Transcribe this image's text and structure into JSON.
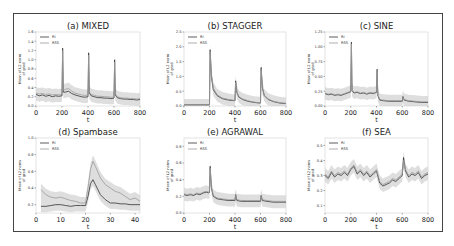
{
  "figure": {
    "frame_color": "#444444",
    "series_colors": {
      "RI": "#333333",
      "RSS": "#9a9a9a",
      "band": "#d0d0d0"
    }
  },
  "chart_data": [
    {
      "id": "a",
      "type": "line",
      "title": "(a) MIXED",
      "xlabel": "t",
      "ylabel": "Mean of L2 norm of grad",
      "xlim": [
        0,
        800
      ],
      "ylim": [
        0.0,
        1.6
      ],
      "xticks": [
        "0",
        "200",
        "400",
        "600",
        "800"
      ],
      "yticks": [
        "0.0",
        "0.2",
        "0.4",
        "0.6",
        "0.8",
        "1.0",
        "1.2",
        "1.4",
        "1.6"
      ],
      "legend": [
        "RI",
        "RSS"
      ],
      "legend_position": "upper left",
      "series": [
        {
          "name": "RI",
          "x": [
            0,
            25,
            50,
            75,
            100,
            125,
            150,
            175,
            200,
            205,
            210,
            225,
            250,
            275,
            300,
            325,
            350,
            375,
            400,
            405,
            410,
            425,
            450,
            475,
            500,
            525,
            550,
            575,
            600,
            605,
            610,
            625,
            650,
            675,
            700,
            725,
            750,
            775,
            800
          ],
          "values": [
            0.25,
            0.22,
            0.24,
            0.21,
            0.23,
            0.2,
            0.22,
            0.21,
            0.22,
            1.25,
            0.3,
            0.3,
            0.32,
            0.27,
            0.24,
            0.22,
            0.2,
            0.19,
            0.2,
            1.15,
            0.28,
            0.22,
            0.2,
            0.18,
            0.18,
            0.17,
            0.17,
            0.16,
            0.17,
            1.0,
            0.24,
            0.18,
            0.16,
            0.15,
            0.15,
            0.14,
            0.14,
            0.13,
            0.14
          ]
        },
        {
          "name": "RSS",
          "x": [
            0,
            25,
            50,
            75,
            100,
            125,
            150,
            175,
            200,
            205,
            210,
            225,
            250,
            275,
            300,
            325,
            350,
            375,
            400,
            405,
            410,
            425,
            450,
            475,
            500,
            525,
            550,
            575,
            600,
            605,
            610,
            625,
            650,
            675,
            700,
            725,
            750,
            775,
            800
          ],
          "values": [
            0.28,
            0.26,
            0.27,
            0.25,
            0.26,
            0.24,
            0.25,
            0.24,
            0.25,
            1.2,
            0.34,
            0.36,
            0.38,
            0.32,
            0.28,
            0.26,
            0.24,
            0.23,
            0.23,
            1.1,
            0.3,
            0.25,
            0.23,
            0.21,
            0.21,
            0.2,
            0.2,
            0.19,
            0.19,
            0.95,
            0.26,
            0.2,
            0.18,
            0.17,
            0.17,
            0.16,
            0.16,
            0.15,
            0.16
          ]
        }
      ]
    },
    {
      "id": "b",
      "type": "line",
      "title": "(b) STAGGER",
      "xlabel": "t",
      "ylabel": "Mean of L2 norm of grad",
      "xlim": [
        0,
        800
      ],
      "ylim": [
        0.0,
        2.5
      ],
      "xticks": [
        "0",
        "200",
        "400",
        "600",
        "800"
      ],
      "yticks": [
        "0.0",
        "0.5",
        "1.0",
        "1.5",
        "2.0",
        "2.5"
      ],
      "legend": [
        "RI",
        "RSS"
      ],
      "legend_position": "upper left",
      "series": [
        {
          "name": "RI",
          "x": [
            0,
            50,
            100,
            150,
            195,
            200,
            205,
            215,
            230,
            260,
            300,
            350,
            395,
            400,
            405,
            415,
            430,
            460,
            500,
            550,
            595,
            600,
            605,
            615,
            630,
            660,
            700,
            750,
            800
          ],
          "values": [
            0.04,
            0.04,
            0.04,
            0.04,
            0.04,
            0.04,
            1.9,
            1.0,
            0.55,
            0.35,
            0.25,
            0.2,
            0.18,
            0.18,
            0.85,
            0.45,
            0.3,
            0.22,
            0.16,
            0.12,
            0.1,
            0.1,
            1.3,
            0.6,
            0.35,
            0.22,
            0.15,
            0.1,
            0.08
          ]
        },
        {
          "name": "RSS",
          "x": [
            0,
            50,
            100,
            150,
            195,
            200,
            205,
            215,
            230,
            260,
            300,
            350,
            395,
            400,
            405,
            415,
            430,
            460,
            500,
            550,
            595,
            600,
            605,
            615,
            630,
            660,
            700,
            750,
            800
          ],
          "values": [
            0.04,
            0.04,
            0.04,
            0.04,
            0.04,
            0.04,
            1.85,
            1.05,
            0.6,
            0.38,
            0.27,
            0.22,
            0.19,
            0.19,
            0.8,
            0.48,
            0.32,
            0.24,
            0.18,
            0.13,
            0.11,
            0.11,
            1.25,
            0.62,
            0.37,
            0.24,
            0.16,
            0.11,
            0.09
          ]
        }
      ]
    },
    {
      "id": "c",
      "type": "line",
      "title": "(c) SINE",
      "xlabel": "t",
      "ylabel": "Mean of L2 norm of grad",
      "xlim": [
        0,
        800
      ],
      "ylim": [
        0.0,
        1.25
      ],
      "xticks": [
        "0",
        "200",
        "400",
        "600",
        "800"
      ],
      "yticks": [
        "0.00",
        "0.25",
        "0.50",
        "0.75",
        "1.00",
        "1.25"
      ],
      "legend": [
        "RI",
        "RSS"
      ],
      "legend_position": "upper left",
      "series": [
        {
          "name": "RI",
          "x": [
            0,
            25,
            50,
            75,
            100,
            125,
            150,
            175,
            200,
            205,
            210,
            225,
            250,
            275,
            300,
            325,
            350,
            375,
            400,
            405,
            410,
            425,
            450,
            500,
            550,
            595,
            600,
            605,
            615,
            650,
            700,
            750,
            800
          ],
          "values": [
            0.21,
            0.19,
            0.2,
            0.18,
            0.19,
            0.18,
            0.2,
            0.22,
            0.24,
            1.08,
            0.26,
            0.22,
            0.23,
            0.21,
            0.22,
            0.2,
            0.22,
            0.21,
            0.23,
            0.62,
            0.18,
            0.1,
            0.09,
            0.08,
            0.08,
            0.08,
            0.08,
            0.16,
            0.1,
            0.08,
            0.07,
            0.06,
            0.06
          ]
        },
        {
          "name": "RSS",
          "x": [
            0,
            25,
            50,
            75,
            100,
            125,
            150,
            175,
            200,
            205,
            210,
            225,
            250,
            275,
            300,
            325,
            350,
            375,
            400,
            405,
            410,
            425,
            450,
            500,
            550,
            595,
            600,
            605,
            615,
            650,
            700,
            750,
            800
          ],
          "values": [
            0.22,
            0.2,
            0.21,
            0.19,
            0.2,
            0.19,
            0.21,
            0.23,
            0.25,
            1.05,
            0.27,
            0.23,
            0.24,
            0.22,
            0.23,
            0.21,
            0.23,
            0.22,
            0.24,
            0.6,
            0.19,
            0.11,
            0.1,
            0.09,
            0.09,
            0.09,
            0.09,
            0.15,
            0.11,
            0.09,
            0.08,
            0.07,
            0.07
          ]
        }
      ]
    },
    {
      "id": "d",
      "type": "line",
      "title": "(d) Spambase",
      "xlabel": "t",
      "ylabel": "Mean of L2 norm of grad",
      "xlim": [
        0,
        42
      ],
      "ylim": [
        0.1,
        1.0
      ],
      "xticks": [
        "0",
        "10",
        "20",
        "30",
        "40"
      ],
      "yticks": [
        "0.2",
        "0.4",
        "0.6",
        "0.8",
        "1.0"
      ],
      "legend": [
        "RI",
        "RSS"
      ],
      "legend_position": "upper left",
      "series": [
        {
          "name": "RI",
          "x": [
            2,
            4,
            6,
            8,
            10,
            12,
            14,
            16,
            18,
            20,
            21,
            22,
            23,
            24,
            26,
            28,
            30,
            32,
            34,
            36,
            38,
            40,
            42
          ],
          "values": [
            0.18,
            0.18,
            0.19,
            0.2,
            0.2,
            0.19,
            0.18,
            0.19,
            0.19,
            0.19,
            0.3,
            0.45,
            0.5,
            0.44,
            0.32,
            0.26,
            0.22,
            0.22,
            0.21,
            0.21,
            0.2,
            0.2,
            0.2
          ]
        },
        {
          "name": "RSS",
          "x": [
            2,
            4,
            6,
            8,
            10,
            12,
            14,
            16,
            18,
            20,
            21,
            22,
            23,
            24,
            26,
            28,
            30,
            32,
            34,
            36,
            38,
            40,
            42
          ],
          "values": [
            0.38,
            0.32,
            0.29,
            0.28,
            0.29,
            0.27,
            0.25,
            0.24,
            0.22,
            0.22,
            0.4,
            0.62,
            0.72,
            0.66,
            0.52,
            0.44,
            0.4,
            0.36,
            0.34,
            0.3,
            0.26,
            0.28,
            0.24
          ]
        }
      ]
    },
    {
      "id": "e",
      "type": "line",
      "title": "(e) AGRAWAL",
      "xlabel": "t",
      "ylabel": "Mean of L2 norm of grad",
      "xlim": [
        0,
        800
      ],
      "ylim": [
        0.0,
        0.9
      ],
      "xticks": [
        "0",
        "200",
        "400",
        "600",
        "800"
      ],
      "yticks": [
        "0.0",
        "0.2",
        "0.4",
        "0.6",
        "0.8"
      ],
      "legend": [
        "RI",
        "RSS"
      ],
      "legend_position": "upper left",
      "series": [
        {
          "name": "RI",
          "x": [
            0,
            25,
            50,
            75,
            100,
            125,
            150,
            175,
            195,
            200,
            205,
            215,
            230,
            260,
            300,
            350,
            395,
            400,
            405,
            415,
            450,
            500,
            550,
            595,
            600,
            605,
            615,
            650,
            700,
            750,
            800
          ],
          "values": [
            0.22,
            0.21,
            0.22,
            0.21,
            0.23,
            0.22,
            0.24,
            0.25,
            0.24,
            0.25,
            0.56,
            0.3,
            0.2,
            0.17,
            0.16,
            0.15,
            0.15,
            0.15,
            0.22,
            0.15,
            0.14,
            0.14,
            0.14,
            0.14,
            0.14,
            0.21,
            0.15,
            0.14,
            0.13,
            0.13,
            0.13
          ]
        },
        {
          "name": "RSS",
          "x": [
            0,
            25,
            50,
            75,
            100,
            125,
            150,
            175,
            195,
            200,
            205,
            215,
            230,
            260,
            300,
            350,
            395,
            400,
            405,
            415,
            450,
            500,
            550,
            595,
            600,
            605,
            615,
            650,
            700,
            750,
            800
          ],
          "values": [
            0.23,
            0.22,
            0.23,
            0.22,
            0.24,
            0.23,
            0.25,
            0.26,
            0.25,
            0.26,
            0.54,
            0.31,
            0.21,
            0.18,
            0.17,
            0.16,
            0.16,
            0.16,
            0.21,
            0.16,
            0.15,
            0.15,
            0.15,
            0.15,
            0.15,
            0.2,
            0.16,
            0.15,
            0.14,
            0.14,
            0.14
          ]
        }
      ]
    },
    {
      "id": "f",
      "type": "line",
      "title": "(f) SEA",
      "xlabel": "t",
      "ylabel": "Mean of L2 norm of grad",
      "xlim": [
        0,
        800
      ],
      "ylim": [
        0.05,
        0.55
      ],
      "xticks": [
        "0",
        "200",
        "400",
        "600",
        "800"
      ],
      "yticks": [
        "0.1",
        "0.2",
        "0.3",
        "0.4",
        "0.5"
      ],
      "legend": [
        "RI",
        "RSS"
      ],
      "legend_position": "upper left",
      "series": [
        {
          "name": "RI",
          "x": [
            0,
            25,
            50,
            75,
            100,
            125,
            150,
            175,
            200,
            225,
            250,
            275,
            300,
            325,
            350,
            375,
            400,
            425,
            450,
            475,
            500,
            525,
            550,
            575,
            600,
            610,
            625,
            650,
            675,
            700,
            725,
            750,
            775,
            800
          ],
          "values": [
            0.3,
            0.28,
            0.32,
            0.29,
            0.31,
            0.3,
            0.32,
            0.3,
            0.34,
            0.36,
            0.31,
            0.33,
            0.3,
            0.32,
            0.29,
            0.31,
            0.33,
            0.25,
            0.23,
            0.24,
            0.25,
            0.27,
            0.26,
            0.28,
            0.3,
            0.42,
            0.33,
            0.29,
            0.31,
            0.3,
            0.32,
            0.28,
            0.3,
            0.31
          ]
        },
        {
          "name": "RSS",
          "x": [
            0,
            25,
            50,
            75,
            100,
            125,
            150,
            175,
            200,
            225,
            250,
            275,
            300,
            325,
            350,
            375,
            400,
            425,
            450,
            475,
            500,
            525,
            550,
            575,
            600,
            610,
            625,
            650,
            675,
            700,
            725,
            750,
            775,
            800
          ],
          "values": [
            0.31,
            0.29,
            0.33,
            0.3,
            0.32,
            0.31,
            0.33,
            0.31,
            0.35,
            0.37,
            0.32,
            0.34,
            0.31,
            0.33,
            0.3,
            0.32,
            0.34,
            0.26,
            0.24,
            0.25,
            0.26,
            0.28,
            0.27,
            0.29,
            0.31,
            0.4,
            0.34,
            0.3,
            0.32,
            0.31,
            0.33,
            0.29,
            0.31,
            0.32
          ]
        }
      ]
    }
  ]
}
